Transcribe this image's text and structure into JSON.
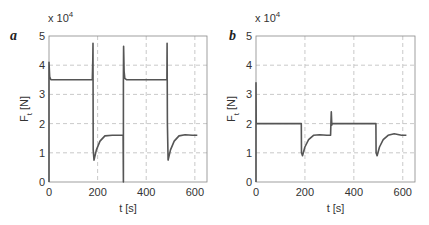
{
  "chart_data": [
    {
      "type": "line",
      "panel_label": "a",
      "title": "",
      "xlabel": "t [s]",
      "ylabel": "F_t [N]",
      "ylabel_main": "F",
      "ylabel_sub": "t",
      "ylabel_unit": " [N]",
      "y_multiplier": "x 10",
      "y_multiplier_exp": "4",
      "xlim": [
        0,
        650
      ],
      "ylim": [
        0,
        5
      ],
      "xticks": [
        0,
        200,
        400,
        600
      ],
      "yticks": [
        0,
        1,
        2,
        3,
        4,
        5
      ],
      "grid": true,
      "series": [
        {
          "name": "F_t",
          "x": [
            0,
            0,
            3,
            8,
            15,
            178,
            180,
            181,
            182,
            185,
            195,
            210,
            230,
            260,
            290,
            305,
            306,
            306,
            307,
            309,
            312,
            320,
            330,
            480,
            485,
            486,
            487,
            490,
            500,
            515,
            535,
            560,
            590,
            610
          ],
          "y": [
            0,
            4.1,
            3.6,
            3.5,
            3.5,
            3.5,
            4.2,
            4.75,
            1.1,
            0.75,
            1.1,
            1.4,
            1.58,
            1.6,
            1.6,
            1.6,
            0,
            3.6,
            4.65,
            3.8,
            3.55,
            3.5,
            3.5,
            3.5,
            3.5,
            4.75,
            2.0,
            0.75,
            1.1,
            1.4,
            1.58,
            1.62,
            1.6,
            1.6
          ]
        }
      ]
    },
    {
      "type": "line",
      "panel_label": "b",
      "title": "",
      "xlabel": "t [s]",
      "ylabel": "F_t [N]",
      "ylabel_main": "F",
      "ylabel_sub": "t",
      "ylabel_unit": " [N]",
      "y_multiplier": "x 10",
      "y_multiplier_exp": "4",
      "xlim": [
        0,
        650
      ],
      "ylim": [
        0,
        5
      ],
      "xticks": [
        0,
        200,
        400,
        600
      ],
      "yticks": [
        0,
        1,
        2,
        3,
        4,
        5
      ],
      "grid": true,
      "series": [
        {
          "name": "F_t",
          "x": [
            0,
            0,
            1,
            2,
            185,
            186,
            190,
            200,
            215,
            235,
            260,
            290,
            305,
            306,
            308,
            310,
            312,
            320,
            490,
            491,
            495,
            505,
            520,
            540,
            565,
            595,
            615
          ],
          "y": [
            0,
            3.4,
            2.0,
            2.0,
            2.0,
            1.0,
            0.9,
            1.2,
            1.45,
            1.6,
            1.62,
            1.6,
            1.6,
            2.0,
            2.4,
            1.95,
            2.0,
            2.0,
            2.0,
            1.0,
            0.9,
            1.2,
            1.45,
            1.6,
            1.65,
            1.6,
            1.6
          ]
        }
      ]
    }
  ]
}
